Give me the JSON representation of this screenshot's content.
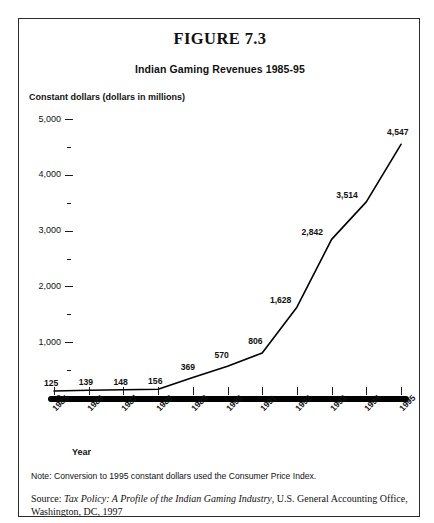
{
  "figure": {
    "title": "FIGURE 7.3",
    "subtitle": "Indian Gaming Revenues  1985-95",
    "y_axis_title": "Constant dollars (dollars in millions)",
    "x_axis_title": "Year",
    "note": "Note: Conversion to 1995 constant dollars used the Consumer Price Index.",
    "source_prefix": "Source: ",
    "source_italic": "Tax Policy: A Profile of the Indian Gaming Industry",
    "source_rest": ", U.S. General Accounting Office, Washington, DC, 1997",
    "frame_color": "#2b2b2b",
    "line_color": "#000000"
  },
  "chart_data": {
    "type": "line",
    "title": "Indian Gaming Revenues  1985-95",
    "xlabel": "Year",
    "ylabel": "Constant dollars (dollars in millions)",
    "x": [
      "1985",
      "1986",
      "1987",
      "1988",
      "1989",
      "1990",
      "1991",
      "1992",
      "1993",
      "1994",
      "1995"
    ],
    "values": [
      125,
      139,
      148,
      156,
      369,
      570,
      806,
      1628,
      2842,
      3514,
      4547
    ],
    "data_labels": [
      "125",
      "139",
      "148",
      "156",
      "369",
      "570",
      "806",
      "1,628",
      "2,842",
      "3,514",
      "4,547"
    ],
    "ylim": [
      0,
      5000
    ],
    "ytick_values": [
      0,
      1000,
      2000,
      3000,
      4000,
      5000
    ],
    "ytick_labels": [
      "0",
      "1,000",
      "2,000",
      "3,000",
      "4,000",
      "5,000"
    ],
    "yminor_values": [
      500,
      1500,
      2500,
      3500,
      4500
    ],
    "grid": false,
    "legend": "none",
    "series_name": "Constant dollars"
  }
}
